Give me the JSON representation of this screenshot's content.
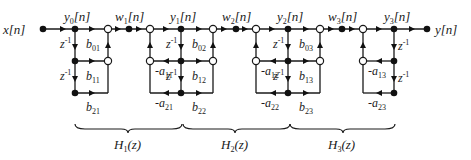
{
  "diagram": {
    "input_label": "x[n]",
    "output_label": "y[n]",
    "delay_label": "z",
    "delay_exp": "-1",
    "signal_labels": [
      {
        "base": "y",
        "sub": "0",
        "suffix": "[n]"
      },
      {
        "base": "w",
        "sub": "1",
        "suffix": "[n]"
      },
      {
        "base": "y",
        "sub": "1",
        "suffix": "[n]"
      },
      {
        "base": "w",
        "sub": "2",
        "suffix": "[n]"
      },
      {
        "base": "y",
        "sub": "2",
        "suffix": "[n]"
      },
      {
        "base": "w",
        "sub": "3",
        "suffix": "[n]"
      },
      {
        "base": "y",
        "sub": "3",
        "suffix": "[n]"
      }
    ],
    "feedforward_coefficients": [
      {
        "base": "b",
        "sub": "01"
      },
      {
        "base": "b",
        "sub": "11"
      },
      {
        "base": "b",
        "sub": "21"
      },
      {
        "base": "b",
        "sub": "02"
      },
      {
        "base": "b",
        "sub": "12"
      },
      {
        "base": "b",
        "sub": "22"
      },
      {
        "base": "b",
        "sub": "03"
      },
      {
        "base": "b",
        "sub": "13"
      },
      {
        "base": "b",
        "sub": "23"
      }
    ],
    "feedback_coefficients": [
      {
        "base": "-a",
        "sub": "11"
      },
      {
        "base": "-a",
        "sub": "21"
      },
      {
        "base": "-a",
        "sub": "12"
      },
      {
        "base": "-a",
        "sub": "22"
      },
      {
        "base": "-a",
        "sub": "13"
      },
      {
        "base": "-a",
        "sub": "23"
      }
    ],
    "sections": [
      {
        "base": "H",
        "sub": "1",
        "suffix": "(z)"
      },
      {
        "base": "H",
        "sub": "2",
        "suffix": "(z)"
      },
      {
        "base": "H",
        "sub": "3",
        "suffix": "(z)"
      }
    ]
  }
}
